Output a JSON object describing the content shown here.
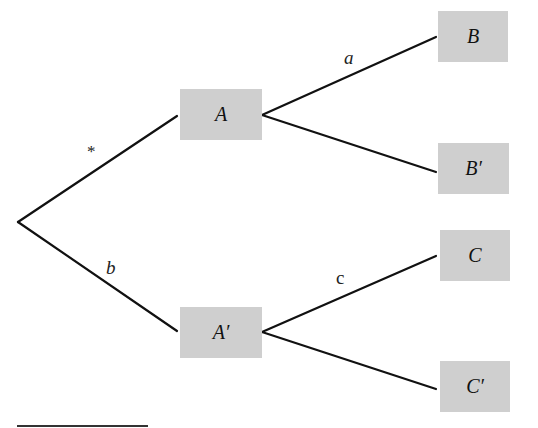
{
  "diagram": {
    "type": "tree",
    "root": {
      "id": "root",
      "label": ""
    },
    "nodes": [
      {
        "id": "A",
        "label": "A"
      },
      {
        "id": "A_prime",
        "label": "A′"
      },
      {
        "id": "B",
        "label": "B"
      },
      {
        "id": "B_prime",
        "label": "B′"
      },
      {
        "id": "C",
        "label": "C"
      },
      {
        "id": "C_prime",
        "label": "C′"
      }
    ],
    "edges": [
      {
        "from": "root",
        "to": "A",
        "label": "*"
      },
      {
        "from": "root",
        "to": "A_prime",
        "label": "b"
      },
      {
        "from": "A",
        "to": "B",
        "label": "a"
      },
      {
        "from": "A",
        "to": "B_prime",
        "label": ""
      },
      {
        "from": "A_prime",
        "to": "C",
        "label": "c"
      },
      {
        "from": "A_prime",
        "to": "C_prime",
        "label": ""
      }
    ],
    "colors": {
      "node_fill": "#cfcfcf",
      "line": "#111111"
    }
  }
}
